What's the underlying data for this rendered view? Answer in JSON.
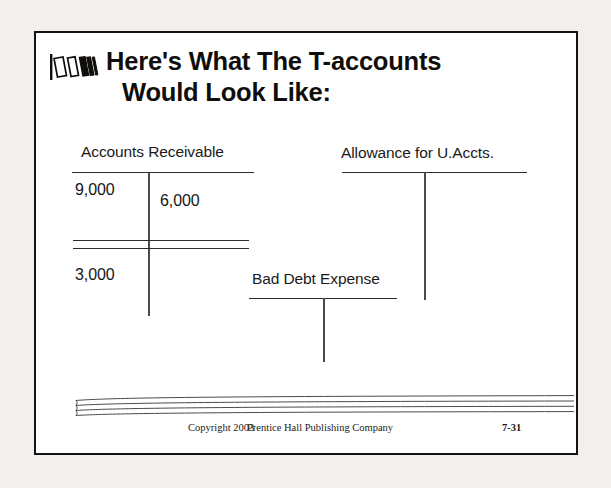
{
  "slide": {
    "title_line1": "Here's What The T-accounts",
    "title_line2": "Would Look Like:",
    "bullet_icon": "striped-bars-bullet-icon",
    "border_color": "#15120f",
    "background_color": "#ffffff",
    "page_background_color": "#f2f0ee"
  },
  "t_accounts": [
    {
      "id": "accounts-receivable",
      "title": "Accounts Receivable",
      "debit_entries": [
        "9,000"
      ],
      "credit_entries": [
        "6,000"
      ],
      "double_rule": true,
      "balance": "3,000",
      "balance_side": "debit"
    },
    {
      "id": "allowance-for-u-accts",
      "title": "Allowance for U.Accts.",
      "debit_entries": [],
      "credit_entries": [],
      "double_rule": false,
      "balance": "",
      "balance_side": ""
    },
    {
      "id": "bad-debt-expense",
      "title": "Bad Debt Expense",
      "debit_entries": [],
      "credit_entries": [],
      "double_rule": false,
      "balance": "",
      "balance_side": ""
    }
  ],
  "footer": {
    "copyright": "Copyright 2003",
    "publisher": "Prentice Hall Publishing Company",
    "slide_number": "7-31",
    "decoration": "four-line-swoosh"
  }
}
